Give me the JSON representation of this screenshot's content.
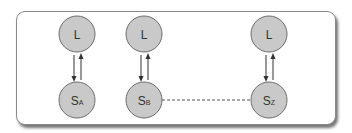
{
  "diagram": {
    "colors": {
      "node_fill": "#c9c9c9",
      "node_stroke": "#6e6e6e",
      "arrow": "#333333",
      "dashed_line": "#555555",
      "frame_border": "#8a8a8a"
    },
    "columns": [
      {
        "top_node": {
          "label": "L"
        },
        "bottom_node": {
          "label": "S",
          "subscript": "A"
        }
      },
      {
        "top_node": {
          "label": "L"
        },
        "bottom_node": {
          "label": "S",
          "subscript": "B"
        }
      },
      {
        "top_node": {
          "label": "L"
        },
        "bottom_node": {
          "label": "S",
          "subscript": "Z"
        }
      }
    ],
    "connectors": {
      "vertical": "bidirectional arrows between L and S in each column",
      "horizontal": "dashed line from S_B to S_Z"
    }
  }
}
